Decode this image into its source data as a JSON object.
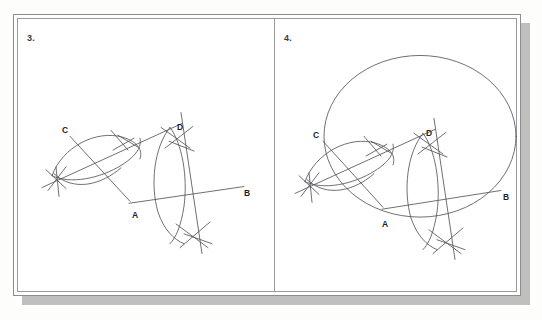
{
  "document": {
    "type": "geometry-construction-worksheet",
    "background_color": "#fdfdfc",
    "frame_color": "#8d8d8d",
    "shadow_color": "#a9a9a9",
    "ink_color": "#55555a"
  },
  "panels": [
    {
      "number": "3.",
      "name": "angle-bisector-and-perpendicular-bisector-construction",
      "labels": {
        "vertex": "A",
        "ray_end_right": "B",
        "ray_end_upper_left": "C",
        "bisector_point": "D"
      },
      "points": {
        "A": {
          "x": 124,
          "y": 196,
          "label": "A",
          "label_x": 126,
          "label_y": 211
        },
        "B": {
          "x": 232,
          "y": 183,
          "label": "B",
          "label_x": 238,
          "label_y": 191
        },
        "C": {
          "x": 68,
          "y": 132,
          "label": "C",
          "label_x": 58,
          "label_y": 127
        },
        "D": {
          "x": 173,
          "y": 124,
          "label": "D",
          "label_x": 170,
          "label_y": 124
        }
      },
      "elements": [
        "ray-AC",
        "ray-AB",
        "arc-from-A-crossing-both-rays",
        "arc-pair-intersection-cross-upper",
        "arc-pair-intersection-cross-lower-left",
        "angle-bisector-line-through-D",
        "perpendicular-bisector-arcs-on-AB",
        "perpendicular-bisector-line"
      ]
    },
    {
      "number": "4.",
      "name": "circumscribed-circle-construction",
      "labels": {
        "vertex": "A",
        "ray_end_right": "B",
        "ray_end_upper_left": "C",
        "bisector_point": "D"
      },
      "points": {
        "A": {
          "x": 372,
          "y": 205,
          "label": "A",
          "label_x": 369,
          "label_y": 217
        },
        "B": {
          "x": 489,
          "y": 184,
          "label": "B",
          "label_x": 492,
          "label_y": 191
        },
        "C": {
          "x": 316,
          "y": 131,
          "label": "C",
          "label_x": 303,
          "label_y": 126
        },
        "D": {
          "x": 414,
          "y": 124,
          "label": "D",
          "label_x": 411,
          "label_y": 124
        }
      },
      "circle": {
        "name": "circumscribed-circle",
        "center_x": 409,
        "center_y": 133,
        "radius_x": 96,
        "radius_y": 82
      },
      "elements": [
        "ray-AC",
        "ray-AB",
        "arc-from-A-crossing-both-rays",
        "arc-pair-intersection-cross-upper",
        "arc-pair-intersection-cross-lower-left",
        "angle-bisector-line-through-D",
        "perpendicular-bisector-arcs-on-AB",
        "perpendicular-bisector-line",
        "circumscribed-circle"
      ]
    }
  ]
}
